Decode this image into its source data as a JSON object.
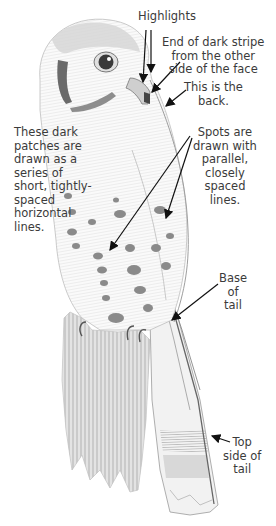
{
  "figure": {
    "annotations": [
      {
        "id": "highlights",
        "text": "Highlights"
      },
      {
        "id": "dark-stripe",
        "text": "End of dark stripe\nfrom the other\nside of the face"
      },
      {
        "id": "back",
        "text": "This is the\nback."
      },
      {
        "id": "dark-patches",
        "text": "These dark\npatches are\ndrawn as a\nseries of\nshort, tightly-\nspaced\nhorizontal\nlines."
      },
      {
        "id": "spots",
        "text": "Spots are\ndrawn with\nparallel,\nclosely\nspaced\nlines."
      },
      {
        "id": "base-of-tail",
        "text": "Base\nof\ntail"
      },
      {
        "id": "top-side-of-tail",
        "text": "Top\nside of\ntail"
      }
    ],
    "colors": {
      "background": "#ffffff",
      "pencil_light": "#d8d8d8",
      "pencil_mid": "#9a9a9a",
      "pencil_dark": "#555555",
      "text": "#3b3b3b",
      "arrow": "#111111"
    }
  }
}
